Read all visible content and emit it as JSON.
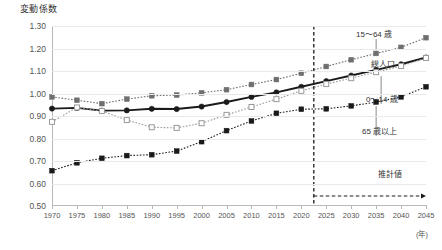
{
  "chart_data": {
    "type": "line",
    "title": "",
    "ylabel": "変動係数",
    "xlabel": "(年)",
    "ylim": [
      0.5,
      1.3
    ],
    "xlim": [
      1970,
      2045
    ],
    "grid": true,
    "legend_position": "inline-right",
    "yticks": [
      "0.50",
      "0.60",
      "0.70",
      "0.80",
      "0.90",
      "1.00",
      "1.10",
      "1.20",
      "1.30"
    ],
    "ytick_values": [
      0.5,
      0.6,
      0.7,
      0.8,
      0.9,
      1.0,
      1.1,
      1.2,
      1.3
    ],
    "categories": [
      1970,
      1975,
      1980,
      1985,
      1990,
      1995,
      2000,
      2005,
      2010,
      2015,
      2020,
      2025,
      2030,
      2035,
      2040,
      2045
    ],
    "xtick_labels": [
      "1970",
      "1975",
      "1980",
      "1985",
      "1990",
      "1995",
      "2000",
      "2005",
      "2010",
      "2015",
      "2020",
      "2025",
      "2030",
      "2035",
      "2040",
      "2045"
    ],
    "series": [
      {
        "name": "15～64 歳",
        "marker": "filled-square",
        "color": "#6e6e6e",
        "line": "dotted",
        "values": [
          0.985,
          0.97,
          0.955,
          0.975,
          0.99,
          0.993,
          1.003,
          1.017,
          1.04,
          1.062,
          1.09,
          1.12,
          1.15,
          1.178,
          1.205,
          1.248
        ]
      },
      {
        "name": "総人口",
        "marker": "filled-circle",
        "color": "#1a1a1a",
        "line": "solid",
        "values": [
          0.933,
          0.936,
          0.924,
          0.925,
          0.932,
          0.931,
          0.942,
          0.962,
          0.985,
          1.005,
          1.03,
          1.055,
          1.08,
          1.105,
          1.13,
          1.16
        ]
      },
      {
        "name": "0～14 歳",
        "marker": "open-square",
        "color": "#9a9a9a",
        "line": "dotted",
        "values": [
          0.874,
          0.938,
          0.922,
          0.882,
          0.85,
          0.847,
          0.868,
          0.905,
          0.94,
          0.975,
          1.012,
          1.042,
          1.068,
          1.095,
          1.122,
          1.158
        ]
      },
      {
        "name": "65 歳以上",
        "marker": "filled-square",
        "color": "#1a1a1a",
        "line": "dotted",
        "values": [
          0.657,
          0.692,
          0.712,
          0.724,
          0.728,
          0.744,
          0.786,
          0.835,
          0.878,
          0.912,
          0.93,
          0.932,
          0.945,
          0.962,
          0.985,
          1.03
        ]
      }
    ],
    "annotations": [
      {
        "text": "推計値",
        "type": "label"
      },
      {
        "text": "estimate-divider",
        "type": "vertical-dashed-line",
        "x": 2022.5
      }
    ]
  },
  "labels": {
    "series_15_64": "15～64 歳",
    "series_total": "総人口",
    "series_0_14": "0～14 歳",
    "series_65_plus": "65 歳以上",
    "estimate": "推計値",
    "year_unit": "(年)",
    "y_axis_title": "変動係数"
  }
}
